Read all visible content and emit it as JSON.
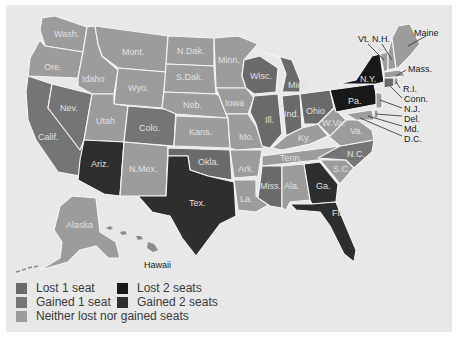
{
  "colors": {
    "background": "#e8e8e8",
    "lost_1": "#6a6a6a",
    "gained_1": "#757575",
    "neither": "#9c9c9c",
    "lost_2": "#181818",
    "gained_2": "#2e2e2e",
    "border": "#f4f4f4"
  },
  "legend": {
    "lost_1": "Lost 1 seat",
    "gained_1": "Gained 1 seat",
    "neither": "Neither lost nor gained seats",
    "lost_2": "Lost 2 seats",
    "gained_2": "Gained 2 seats"
  },
  "states": {
    "wash": {
      "label": "Wash.",
      "category": "neither"
    },
    "ore": {
      "label": "Ore.",
      "category": "neither"
    },
    "calif": {
      "label": "Calif.",
      "category": "gained_1"
    },
    "nev": {
      "label": "Nev.",
      "category": "gained_1"
    },
    "idaho": {
      "label": "Idaho",
      "category": "neither"
    },
    "mont": {
      "label": "Mont.",
      "category": "neither"
    },
    "wyo": {
      "label": "Wyo.",
      "category": "neither"
    },
    "utah": {
      "label": "Utah",
      "category": "neither"
    },
    "colo": {
      "label": "Colo.",
      "category": "gained_1"
    },
    "ariz": {
      "label": "Ariz.",
      "category": "gained_2"
    },
    "nmex": {
      "label": "N.Mex.",
      "category": "neither"
    },
    "ndak": {
      "label": "N.Dak.",
      "category": "neither"
    },
    "sdak": {
      "label": "S.Dak.",
      "category": "neither"
    },
    "neb": {
      "label": "Neb.",
      "category": "neither"
    },
    "kans": {
      "label": "Kans.",
      "category": "neither"
    },
    "okla": {
      "label": "Okla.",
      "category": "lost_1"
    },
    "tex": {
      "label": "Tex.",
      "category": "gained_2"
    },
    "minn": {
      "label": "Minn.",
      "category": "neither"
    },
    "iowa": {
      "label": "Iowa",
      "category": "neither"
    },
    "mo": {
      "label": "Mo.",
      "category": "neither"
    },
    "ark": {
      "label": "Ark.",
      "category": "neither"
    },
    "la": {
      "label": "La.",
      "category": "neither"
    },
    "wisc": {
      "label": "Wisc.",
      "category": "lost_1"
    },
    "ill": {
      "label": "Ill.",
      "category": "lost_1"
    },
    "mich": {
      "label": "Mich.",
      "category": "lost_1"
    },
    "ind": {
      "label": "Ind.",
      "category": "lost_1"
    },
    "ohio": {
      "label": "Ohio",
      "category": "lost_1"
    },
    "ky": {
      "label": "Ky.",
      "category": "neither"
    },
    "tenn": {
      "label": "Tenn.",
      "category": "neither"
    },
    "miss": {
      "label": "Miss.",
      "category": "lost_1"
    },
    "ala": {
      "label": "Ala.",
      "category": "neither"
    },
    "ga": {
      "label": "Ga.",
      "category": "gained_2"
    },
    "fla": {
      "label": "Fla.",
      "category": "gained_2"
    },
    "sc": {
      "label": "S.C.",
      "category": "neither"
    },
    "nc": {
      "label": "N.C.",
      "category": "gained_1"
    },
    "va": {
      "label": "Va.",
      "category": "neither"
    },
    "wva": {
      "label": "W.Va.",
      "category": "neither"
    },
    "pa": {
      "label": "Pa.",
      "category": "lost_2"
    },
    "ny": {
      "label": "N.Y.",
      "category": "lost_2"
    },
    "vt": {
      "label": "Vt.",
      "category": "neither"
    },
    "nh": {
      "label": "N.H.",
      "category": "neither"
    },
    "maine": {
      "label": "Maine",
      "category": "neither"
    },
    "mass": {
      "label": "Mass.",
      "category": "neither"
    },
    "ri": {
      "label": "R.I.",
      "category": "neither"
    },
    "conn": {
      "label": "Conn.",
      "category": "lost_1"
    },
    "nj": {
      "label": "N.J.",
      "category": "neither"
    },
    "del": {
      "label": "Del.",
      "category": "neither"
    },
    "md": {
      "label": "Md.",
      "category": "neither"
    },
    "dc": {
      "label": "D.C.",
      "category": "neither"
    },
    "alaska": {
      "label": "Alaska",
      "category": "neither"
    },
    "hawaii": {
      "label": "Hawaii",
      "category": "neither"
    }
  }
}
